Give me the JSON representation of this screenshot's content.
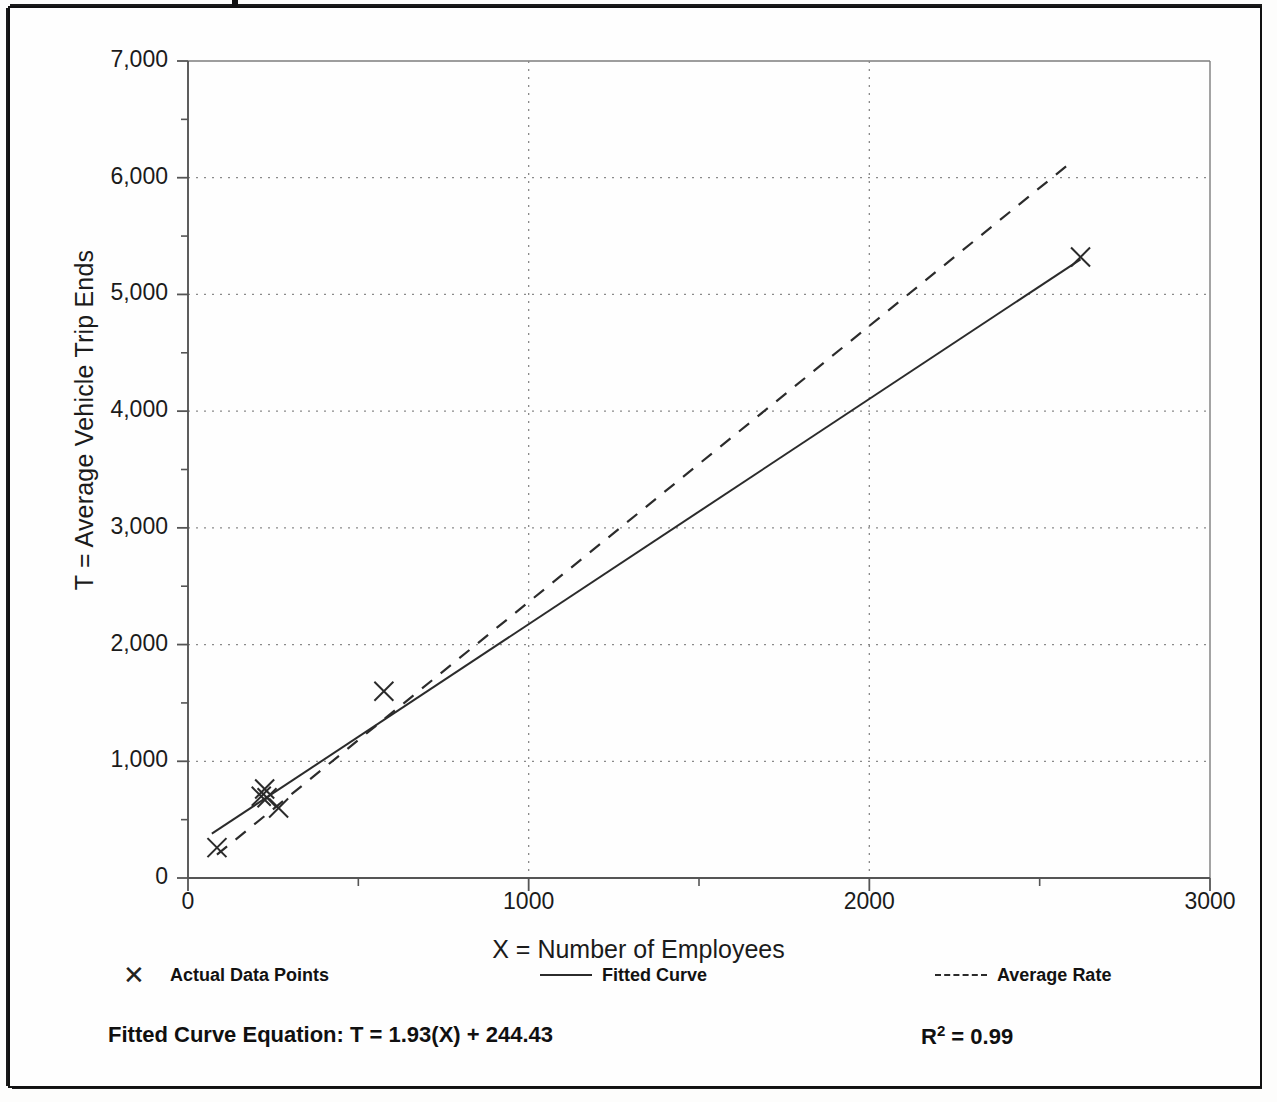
{
  "chart_data": {
    "type": "scatter",
    "title": "",
    "xlabel": "X = Number of Employees",
    "ylabel": "T = Average Vehicle Trip Ends",
    "xlim": [
      0,
      3000
    ],
    "ylim": [
      0,
      7000
    ],
    "xticks": [
      "0",
      "1000",
      "2000",
      "3000"
    ],
    "xtick_values": [
      0,
      1000,
      2000,
      3000
    ],
    "xminor_values": [
      500,
      1500,
      2500
    ],
    "yticks": [
      "0",
      "1,000",
      "2,000",
      "3,000",
      "4,000",
      "5,000",
      "6,000",
      "7,000"
    ],
    "ytick_values": [
      0,
      1000,
      2000,
      3000,
      4000,
      5000,
      6000,
      7000
    ],
    "yminor_values": [
      500,
      1500,
      2500,
      3500,
      4500,
      5500,
      6500
    ],
    "grid": "dotted horizontal at major y, dotted vertical at x=1000 and x=2000",
    "legend_position": "below plot",
    "series": [
      {
        "name": "Actual Data Points",
        "type": "scatter",
        "marker": "x",
        "points": [
          {
            "x": 85,
            "y": 260
          },
          {
            "x": 215,
            "y": 700
          },
          {
            "x": 225,
            "y": 762
          },
          {
            "x": 232,
            "y": 688
          },
          {
            "x": 266,
            "y": 600
          },
          {
            "x": 575,
            "y": 1600
          },
          {
            "x": 2620,
            "y": 5320
          }
        ]
      },
      {
        "name": "Fitted Curve",
        "type": "line",
        "style": "solid",
        "equation": "T = 1.93(X) + 244.43",
        "slope": 1.93,
        "intercept": 244.43,
        "x_start": 70,
        "x_end": 2620,
        "y_start": 380,
        "y_end": 5301
      },
      {
        "name": "Average Rate",
        "type": "line",
        "style": "dashed",
        "slope": 2.365,
        "intercept": 0,
        "x_start": 85,
        "x_end": 2600,
        "y_start": 200,
        "y_end": 6150
      }
    ]
  },
  "axes": {
    "y_title": "T = Average Vehicle Trip Ends",
    "x_title": "X = Number of Employees"
  },
  "legend": {
    "items": [
      {
        "marker": "x-marker",
        "label": "Actual Data Points"
      },
      {
        "marker": "solid-line",
        "label": "Fitted Curve"
      },
      {
        "marker": "dashed-line",
        "label": "Average Rate"
      }
    ]
  },
  "footer": {
    "equation_label": "Fitted Curve Equation:  T = 1.93(X) + 244.43",
    "r_squared_prefix": "R",
    "r_squared_sup": "2",
    "r_squared_value": " = 0.99"
  },
  "colors": {
    "frame": "#111111",
    "line": "#2b2b2b",
    "grid": "#8a8a8a",
    "text": "#101010",
    "background": "#fefefe"
  }
}
